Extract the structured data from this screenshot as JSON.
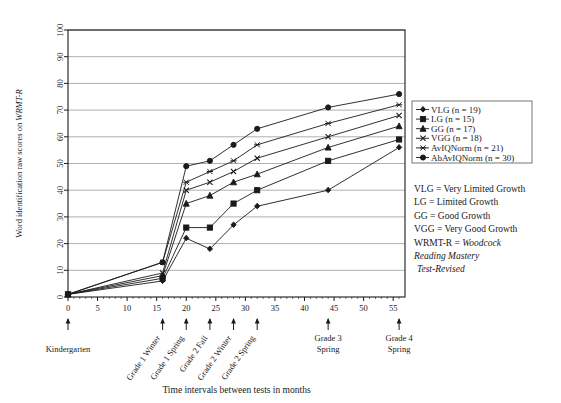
{
  "chart_data": {
    "type": "line",
    "title": "",
    "xlabel": "Time intervals between tests in months",
    "ylabel_parts": {
      "plain": "Word identification raw scores on ",
      "italic": "WRMT-R"
    },
    "ylabel": "Word identification raw scores on WRMT-R",
    "xlim": [
      0,
      57
    ],
    "ylim": [
      0,
      100
    ],
    "grid": true,
    "xticks": [
      0,
      5,
      10,
      15,
      20,
      25,
      30,
      35,
      40,
      45,
      50,
      55
    ],
    "yticks": [
      0,
      10,
      20,
      30,
      40,
      50,
      60,
      70,
      80,
      90,
      100
    ],
    "x": [
      0,
      16,
      20,
      24,
      28,
      32,
      44,
      56
    ],
    "legend_position": "right",
    "series": [
      {
        "name": "VLG (n = 19)",
        "key": "VLG",
        "marker": "diamond",
        "values": [
          1,
          6,
          22,
          18,
          27,
          34,
          40,
          56
        ]
      },
      {
        "name": "LG (n = 15)",
        "key": "LG",
        "marker": "square",
        "values": [
          1,
          7,
          26,
          26,
          35,
          40,
          51,
          59
        ]
      },
      {
        "name": "GG (n = 17)",
        "key": "GG",
        "marker": "triangle",
        "values": [
          1,
          8,
          35,
          38,
          43,
          46,
          56,
          64
        ]
      },
      {
        "name": "VGG (n = 18)",
        "key": "VGG",
        "marker": "cross",
        "values": [
          1,
          9,
          40,
          43,
          47,
          52,
          60,
          68
        ]
      },
      {
        "name": "AvIQNorm (n = 21)",
        "key": "AvIQNorm",
        "marker": "star",
        "values": [
          1,
          13,
          43,
          47,
          51,
          57,
          65,
          72
        ]
      },
      {
        "name": "AbAvIQNorm (n = 30)",
        "key": "AbAvIQNorm",
        "marker": "circle",
        "values": [
          1,
          13,
          49,
          51,
          57,
          63,
          71,
          76
        ]
      }
    ],
    "annotations": [
      {
        "label": "Kindergarten",
        "x": 0,
        "rotate": 0
      },
      {
        "label": "Grade 1 Winter",
        "x": 16,
        "rotate": -55
      },
      {
        "label": "Grade 1 Spring",
        "x": 20,
        "rotate": -55
      },
      {
        "label": "Grade 2 Fall",
        "x": 24,
        "rotate": -55
      },
      {
        "label": "Grade 2 Winter",
        "x": 28,
        "rotate": -55
      },
      {
        "label": "Grade 2 Spring",
        "x": 32,
        "rotate": -55
      },
      {
        "label": "Grade 3 Spring",
        "x": 44,
        "rotate": 0
      },
      {
        "label": "Grade 4 Spring",
        "x": 56,
        "rotate": 0
      }
    ]
  },
  "abbreviations": [
    "VLG = Very Limited Growth",
    "LG = Limited Growth",
    "GG = Good Growth",
    "VGG = Very Good Growth"
  ],
  "wrmt_note": {
    "plain": "WRMT-R = ",
    "italic1": "Woodcock",
    "italic2": "Reading Mastery",
    "italic3": "Test-Revised"
  },
  "colors": {
    "line": "#1a1a1a",
    "grid": "#9a9a9a",
    "axis": "#1a1a1a",
    "background": "#ffffff"
  }
}
